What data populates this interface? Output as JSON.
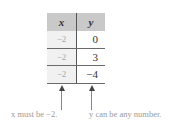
{
  "table": {
    "headers": [
      "x",
      "y"
    ],
    "rows": [
      {
        "x": "−2",
        "y": "0"
      },
      {
        "x": "−2",
        "y": "3"
      },
      {
        "x": "−2",
        "y": "−4"
      }
    ]
  },
  "annotations": {
    "x_note": "x must be −2.",
    "y_note": "y can be any number."
  },
  "colors": {
    "header_bg": "#c9c9c9",
    "x_cell_bg": "#f1f1f1",
    "rule": "#6a6a6a"
  }
}
